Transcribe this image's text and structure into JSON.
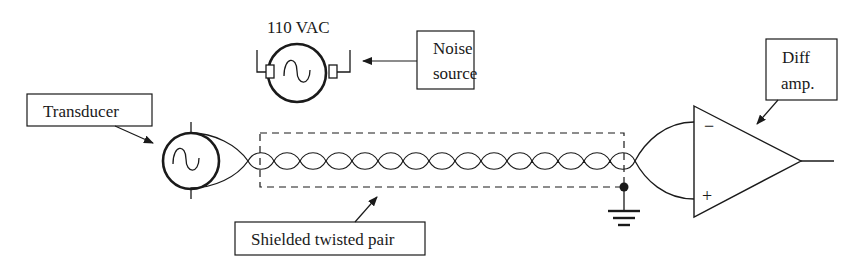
{
  "labels": {
    "ac_source": "110 VAC",
    "noise_source_line1": "Noise",
    "noise_source_line2": "source",
    "transducer": "Transducer",
    "diff_amp_line1": "Diff",
    "diff_amp_line2": "amp.",
    "cable": "Shielded twisted pair"
  },
  "amp_inputs": {
    "inverting": "−",
    "non_inverting": "+"
  },
  "colors": {
    "stroke": "#1a1a1a",
    "background": "#ffffff"
  },
  "twisted_pair": {
    "loop_count": 15
  }
}
